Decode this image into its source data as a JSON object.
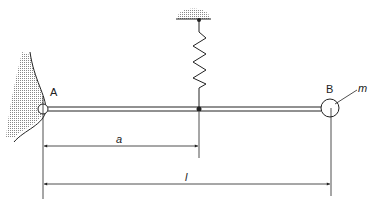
{
  "diagram": {
    "labels": {
      "pivot": "A",
      "end": "B",
      "mass": "m",
      "dim_spring": "a",
      "dim_length": "l"
    },
    "colors": {
      "line": "#222222",
      "hatch": "#999999"
    }
  }
}
